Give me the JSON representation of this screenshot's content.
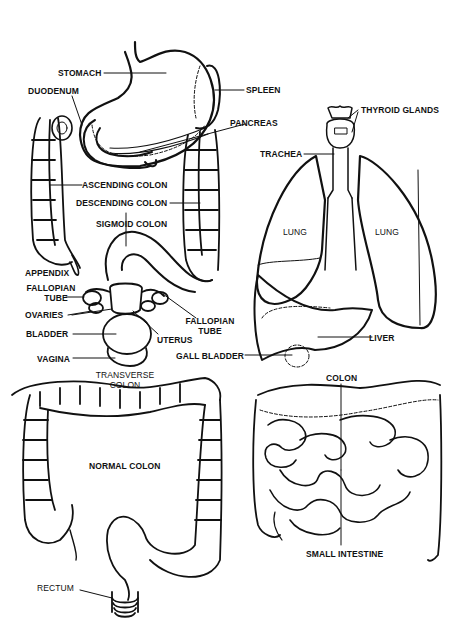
{
  "diagram": {
    "colors": {
      "ink": "#111111",
      "background": "#ffffff"
    },
    "labels": {
      "stomach": "STOMACH",
      "duodenum": "DUODENUM",
      "spleen": "SPLEEN",
      "pancreas": "PANCREAS",
      "thyroid_glands": "THYROID GLANDS",
      "trachea": "TRACHEA",
      "ascending_colon": "ASCENDING COLON",
      "descending_colon": "DESCENDING COLON",
      "sigmoid_colon": "SIGMOID COLON",
      "lung_left": "LUNG",
      "lung_right": "LUNG",
      "appendix": "APPENDIX",
      "fallopian_tube_left_1": "FALLOPIAN",
      "fallopian_tube_left_2": "TUBE",
      "ovaries": "OVARIES",
      "fallopian_tube_right_1": "FALLOPIAN",
      "fallopian_tube_right_2": "TUBE",
      "bladder": "BLADDER",
      "uterus": "UTERUS",
      "liver": "LIVER",
      "vagina": "VAGINA",
      "gall_bladder": "GALL BLADDER",
      "transverse_colon_1": "TRANSVERSE",
      "transverse_colon_2": "COLON",
      "colon": "COLON",
      "normal_colon": "NORMAL COLON",
      "small_intestine": "SMALL INTESTINE",
      "rectum": "RECTUM"
    }
  }
}
